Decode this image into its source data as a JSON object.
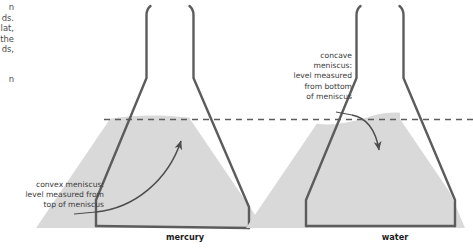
{
  "figure": {
    "background_color": "#ffffff",
    "liquid_fill_color": "#d9d9d9",
    "glass_outline_color": "#5c5c5c",
    "dashed_line_color": "#5c5c5c",
    "arrow_color": "#4d4d4d",
    "text_color": "#3b3b3b"
  },
  "page_text": {
    "fragment_top": "n\nds.\nlat,\nthe\nds,",
    "fragment_bottom": "n"
  },
  "callouts": {
    "convex": "convex meniscus:\nlevel measured from\ntop of meniscus",
    "concave": "concave\nmeniscus:\nlevel measured\nfrom bottom\nof meniscus"
  },
  "flasks": {
    "left": {
      "label": "mercury",
      "meniscus_type": "convex",
      "measure_point": "top of meniscus"
    },
    "right": {
      "label": "water",
      "meniscus_type": "concave",
      "measure_point": "bottom of meniscus"
    }
  },
  "reference_line": {
    "style": "dashed",
    "meaning": "measured liquid level"
  }
}
